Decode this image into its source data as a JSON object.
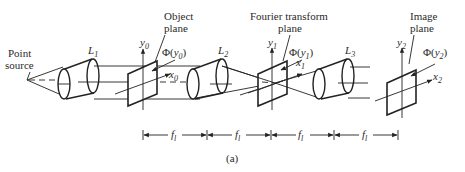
{
  "figure": {
    "caption": "(a)",
    "labels": {
      "point_source_line1": "Point",
      "point_source_line2": "source",
      "object_plane_line1": "Object",
      "object_plane_line2": "plane",
      "fourier_plane_line1": "Fourier transform",
      "fourier_plane_line2": "plane",
      "image_plane_line1": "Image",
      "image_plane_line2": "plane"
    },
    "lenses": [
      {
        "name": "L",
        "sub": "1"
      },
      {
        "name": "L",
        "sub": "2"
      },
      {
        "name": "L",
        "sub": "3"
      }
    ],
    "axes": {
      "y0": {
        "name": "y",
        "sub": "0"
      },
      "x0": {
        "name": "x",
        "sub": "0"
      },
      "y1": {
        "name": "y",
        "sub": "1"
      },
      "x1": {
        "name": "x",
        "sub": "1"
      },
      "y2": {
        "name": "y",
        "sub": "2"
      },
      "x2": {
        "name": "x",
        "sub": "2"
      }
    },
    "phases": {
      "phi0": {
        "prefix": "Φ(",
        "var": "y",
        "sub": "0",
        "suffix": ")"
      },
      "phi1": {
        "prefix": "Φ(",
        "var": "y",
        "sub": "1",
        "suffix": ")"
      },
      "phi2": {
        "prefix": "Φ(",
        "var": "y",
        "sub": "2",
        "suffix": ")"
      }
    },
    "focal_spacings": [
      {
        "name": "f",
        "sub": "l"
      },
      {
        "name": "f",
        "sub": "l"
      },
      {
        "name": "f",
        "sub": "l"
      },
      {
        "name": "f",
        "sub": "l"
      }
    ]
  }
}
